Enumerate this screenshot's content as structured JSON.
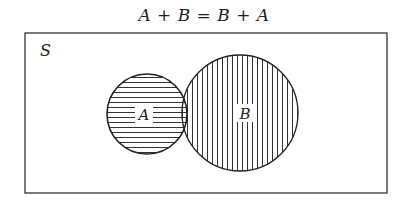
{
  "title": "A + B = B + A",
  "diagram": {
    "type": "venn",
    "universe_label": "S",
    "sets": [
      {
        "label": "A",
        "hatch": "horizontal"
      },
      {
        "label": "B",
        "hatch": "vertical"
      }
    ],
    "intersection_hatch": "crosshatch",
    "colors": {
      "stroke": "#222222",
      "background": "#ffffff"
    }
  }
}
